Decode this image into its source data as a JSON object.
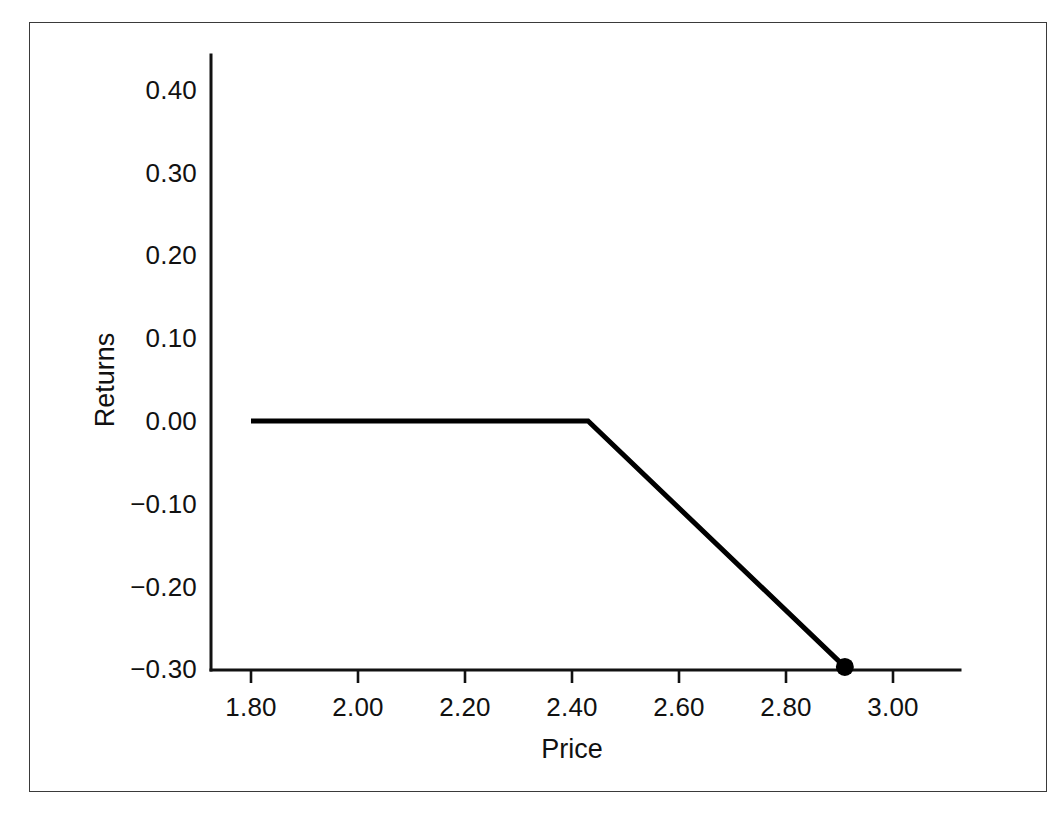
{
  "figure": {
    "background_color": "#ffffff",
    "frame_color": "#3a3a3a",
    "line_color": "#000000",
    "axis_color": "#111111"
  },
  "chart_data": {
    "type": "line",
    "title": "",
    "subtitle": "",
    "xlabel": "Price",
    "ylabel": "Returns",
    "xlim": [
      1.72,
      3.08
    ],
    "ylim": [
      -0.3,
      0.46
    ],
    "xticks": [
      1.8,
      2.0,
      2.2,
      2.4,
      2.6,
      2.8,
      3.0
    ],
    "xtick_labels": [
      "1.80",
      "2.00",
      "2.20",
      "2.40",
      "2.60",
      "2.80",
      "3.00"
    ],
    "yticks": [
      0.4,
      0.3,
      0.2,
      0.1,
      0.0,
      -0.1,
      -0.2,
      -0.3
    ],
    "ytick_labels": [
      "0.40",
      "0.30",
      "0.20",
      "0.10",
      "0.00",
      "−0.10",
      "−0.20",
      "−0.30"
    ],
    "grid": false,
    "legend": null,
    "series": [
      {
        "name": "Returns",
        "x": [
          1.8,
          2.43,
          2.91
        ],
        "y": [
          0.0,
          0.0,
          -0.297
        ],
        "marker_points": [
          {
            "x": 2.91,
            "y": -0.297
          }
        ]
      }
    ],
    "annotations": []
  }
}
